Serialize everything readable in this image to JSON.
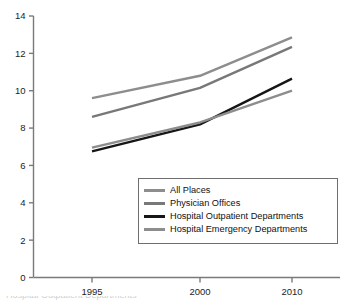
{
  "chart_data": {
    "type": "line",
    "title": "",
    "xlabel": "",
    "ylabel": "",
    "x": [
      1995,
      2000,
      2010
    ],
    "categories": [
      "1995",
      "2000",
      "2010"
    ],
    "xtick_labels": [
      "1995",
      "2000",
      "2010"
    ],
    "ytick_labels": [
      "0",
      "2",
      "4",
      "6",
      "8",
      "10",
      "12",
      "14"
    ],
    "yticks": [
      0,
      2,
      4,
      6,
      8,
      10,
      12,
      14
    ],
    "ylim": [
      0,
      14
    ],
    "grid": false,
    "legend_position": "lower-center-right",
    "series": [
      {
        "name": "All Places",
        "color": "#8d8d8d",
        "width": 2.4,
        "values": [
          9.6,
          10.8,
          12.85
        ]
      },
      {
        "name": "Physician Offices",
        "color": "#787878",
        "width": 2.4,
        "values": [
          8.6,
          10.15,
          12.35
        ]
      },
      {
        "name": "Hospital Outpatient Departments",
        "color": "#161616",
        "width": 2.4,
        "values": [
          6.75,
          8.2,
          10.65
        ]
      },
      {
        "name": "Hospital Emergency Departments",
        "color": "#8d8d8d",
        "width": 2.4,
        "values": [
          6.95,
          8.3,
          10.0
        ]
      }
    ]
  },
  "axis": {
    "line_color": "#7a7a7a",
    "tick_color": "#7a7a7a"
  },
  "legend": {
    "items": [
      {
        "label": "All Places",
        "color": "#8d8d8d"
      },
      {
        "label": "Physician Offices",
        "color": "#787878"
      },
      {
        "label": "Hospital Outpatient Departments",
        "color": "#161616"
      },
      {
        "label": "Hospital Emergency Departments",
        "color": "#8d8d8d"
      }
    ]
  },
  "caption": {
    "clipped_text": "Hospital Outpatient Departments"
  }
}
